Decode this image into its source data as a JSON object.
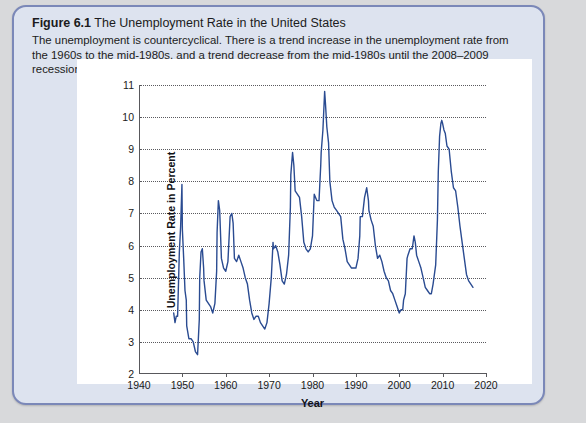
{
  "figure": {
    "number_label": "Figure 6.1",
    "title": "The Unemployment Rate in the United States",
    "caption": "The unemployment is countercyclical. There is a trend increase in the unemployment rate from the 1960s to the mid-1980s, and a trend decrease from the mid-1980s until the 2008–2009 recession."
  },
  "colors": {
    "line": "#2a4b91",
    "panel": "#ffffff",
    "box_border": "#7b88b8",
    "box_fill": "#dde3ef",
    "page": "#d8d9db",
    "axis": "#58585c"
  },
  "chart_data": {
    "type": "line",
    "title": "The Unemployment Rate in the United States",
    "xlabel": "Year",
    "ylabel": "Unemployment Rate in Percent",
    "xlim": [
      1940,
      2020
    ],
    "ylim": [
      2,
      11
    ],
    "xticks": [
      1940,
      1950,
      1960,
      1970,
      1980,
      1990,
      2000,
      2010,
      2020
    ],
    "yticks": [
      2,
      3,
      4,
      5,
      6,
      7,
      8,
      9,
      10,
      11
    ],
    "grid": "horizontal-dotted",
    "legend": "none",
    "series": [
      {
        "name": "Unemployment Rate",
        "color": "#2a4b91",
        "x": [
          1948.0,
          1948.3,
          1948.6,
          1948.9,
          1949.0,
          1949.3,
          1949.6,
          1949.9,
          1950.0,
          1950.3,
          1950.6,
          1950.9,
          1951.0,
          1951.5,
          1952.0,
          1952.5,
          1953.0,
          1953.5,
          1953.9,
          1954.0,
          1954.3,
          1954.6,
          1954.9,
          1955.0,
          1955.5,
          1956.0,
          1956.5,
          1957.0,
          1957.5,
          1957.9,
          1958.0,
          1958.3,
          1958.6,
          1959.0,
          1959.5,
          1960.0,
          1960.5,
          1960.9,
          1961.0,
          1961.4,
          1961.7,
          1962.0,
          1962.5,
          1963.0,
          1963.5,
          1964.0,
          1964.5,
          1965.0,
          1965.5,
          1966.0,
          1966.5,
          1967.0,
          1967.5,
          1968.0,
          1968.5,
          1969.0,
          1969.5,
          1970.0,
          1970.5,
          1970.9,
          1971.0,
          1971.5,
          1972.0,
          1972.5,
          1973.0,
          1973.5,
          1974.0,
          1974.5,
          1974.9,
          1975.0,
          1975.4,
          1975.7,
          1976.0,
          1976.5,
          1977.0,
          1977.5,
          1978.0,
          1978.5,
          1979.0,
          1979.5,
          1980.0,
          1980.4,
          1980.7,
          1981.0,
          1981.5,
          1981.9,
          1982.0,
          1982.4,
          1982.8,
          1983.0,
          1983.3,
          1983.7,
          1984.0,
          1984.5,
          1985.0,
          1985.5,
          1986.0,
          1986.5,
          1987.0,
          1987.5,
          1988.0,
          1988.5,
          1989.0,
          1989.5,
          1990.0,
          1990.5,
          1990.9,
          1991.0,
          1991.5,
          1992.0,
          1992.5,
          1992.9,
          1993.0,
          1993.5,
          1994.0,
          1994.5,
          1995.0,
          1995.5,
          1996.0,
          1996.5,
          1997.0,
          1997.5,
          1998.0,
          1998.5,
          1999.0,
          1999.5,
          2000.0,
          2000.4,
          2000.8,
          2001.0,
          2001.4,
          2001.8,
          2002.0,
          2002.5,
          2003.0,
          2003.4,
          2003.7,
          2004.0,
          2004.5,
          2005.0,
          2005.5,
          2006.0,
          2006.5,
          2007.0,
          2007.4,
          2007.8,
          2008.0,
          2008.4,
          2008.8,
          2009.0,
          2009.3,
          2009.6,
          2009.8,
          2010.0,
          2010.3,
          2010.6,
          2011.0,
          2011.5,
          2012.0,
          2012.5,
          2013.0,
          2013.5,
          2014.0,
          2014.5,
          2015.0,
          2015.5,
          2016.0,
          2016.5,
          2017.0
        ],
        "y": [
          3.9,
          3.6,
          3.8,
          3.8,
          4.3,
          5.8,
          6.6,
          7.9,
          6.5,
          5.6,
          4.6,
          4.3,
          3.5,
          3.1,
          3.1,
          3.0,
          2.7,
          2.6,
          3.7,
          5.0,
          5.8,
          5.9,
          5.3,
          4.9,
          4.3,
          4.2,
          4.1,
          3.9,
          4.2,
          5.2,
          6.4,
          7.4,
          7.1,
          5.6,
          5.3,
          5.2,
          5.5,
          6.6,
          6.9,
          7.0,
          6.7,
          5.6,
          5.5,
          5.7,
          5.5,
          5.3,
          5.0,
          4.8,
          4.3,
          3.9,
          3.7,
          3.8,
          3.8,
          3.6,
          3.5,
          3.4,
          3.6,
          4.2,
          5.0,
          6.1,
          5.9,
          6.0,
          5.8,
          5.4,
          4.9,
          4.8,
          5.1,
          5.7,
          7.2,
          8.2,
          8.9,
          8.5,
          7.7,
          7.6,
          7.5,
          6.9,
          6.1,
          5.9,
          5.8,
          5.9,
          6.3,
          7.6,
          7.5,
          7.4,
          7.4,
          8.5,
          8.9,
          9.6,
          10.8,
          10.4,
          9.7,
          9.2,
          8.0,
          7.4,
          7.2,
          7.1,
          7.0,
          6.9,
          6.2,
          5.9,
          5.5,
          5.4,
          5.3,
          5.3,
          5.3,
          5.6,
          6.3,
          6.9,
          6.9,
          7.5,
          7.8,
          7.4,
          7.1,
          6.8,
          6.6,
          6.0,
          5.6,
          5.7,
          5.5,
          5.2,
          5.0,
          4.9,
          4.6,
          4.5,
          4.3,
          4.1,
          3.9,
          4.0,
          4.0,
          4.3,
          4.5,
          5.6,
          5.7,
          5.9,
          5.9,
          6.3,
          6.1,
          5.7,
          5.5,
          5.3,
          5.0,
          4.7,
          4.6,
          4.5,
          4.5,
          4.8,
          5.0,
          5.4,
          6.8,
          8.3,
          9.4,
          9.8,
          9.9,
          9.8,
          9.6,
          9.5,
          9.1,
          9.0,
          8.3,
          7.8,
          7.7,
          7.2,
          6.6,
          6.1,
          5.6,
          5.1,
          4.9,
          4.8,
          4.7
        ]
      }
    ]
  }
}
